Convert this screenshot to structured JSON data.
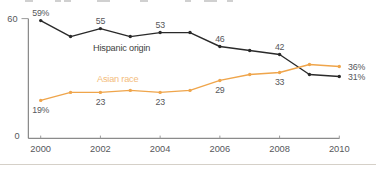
{
  "chart_data": {
    "type": "line",
    "x": [
      2000,
      2001,
      2002,
      2003,
      2004,
      2005,
      2006,
      2007,
      2008,
      2009,
      2010
    ],
    "x_tick_labels": [
      "2000",
      "2002",
      "2004",
      "2006",
      "2008",
      "2010"
    ],
    "x_tick_years": [
      2000,
      2002,
      2004,
      2006,
      2008,
      2010
    ],
    "ylim": [
      0,
      60
    ],
    "y_ticks": [
      {
        "value": 60,
        "label": "60"
      },
      {
        "value": 0,
        "label": "0"
      }
    ],
    "grid": false,
    "legend_position": "inline-labels",
    "series": [
      {
        "name": "Hispanic origin",
        "color": "#2a2a2a",
        "name_color": "#3f3f3f",
        "values": [
          59,
          51,
          55,
          51,
          53,
          53,
          46,
          44,
          42,
          32,
          31
        ],
        "point_labels": [
          {
            "year": 2000,
            "text": "59%"
          },
          {
            "year": 2002,
            "text": "55"
          },
          {
            "year": 2004,
            "text": "53"
          },
          {
            "year": 2006,
            "text": "46"
          },
          {
            "year": 2008,
            "text": "42"
          },
          {
            "year": 2010,
            "text": "31%"
          }
        ]
      },
      {
        "name": "Asian race",
        "color": "#efa54b",
        "name_color": "#f3bc7c",
        "values": [
          19,
          23,
          23,
          24,
          23,
          24,
          29,
          32,
          33,
          37,
          36
        ],
        "point_labels": [
          {
            "year": 2000,
            "text": "19%"
          },
          {
            "year": 2002,
            "text": "23"
          },
          {
            "year": 2004,
            "text": "23"
          },
          {
            "year": 2006,
            "text": "29"
          },
          {
            "year": 2008,
            "text": "33"
          },
          {
            "year": 2010,
            "text": "36%"
          }
        ]
      }
    ],
    "value_label_color": "#56575b",
    "axis_color": "#6e6e6e",
    "tick_color": "#9c9c9c",
    "year_label_color": "#56575b"
  }
}
